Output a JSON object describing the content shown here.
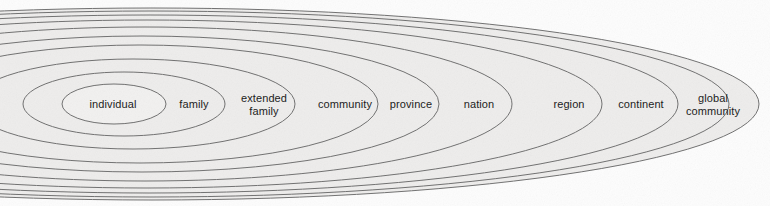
{
  "figure": {
    "kind": "nested-ellipses-diagram",
    "canvas": {
      "width": 770,
      "height": 206
    },
    "colors": {
      "background": "#fdfdfd",
      "ring_fill": "#eeedec",
      "innermost_fill": "#f2f1f0",
      "stroke": "#6f6f6f",
      "text": "#1d1d1d"
    }
  },
  "chart_data": {
    "type": "diagram",
    "title": "",
    "layout": "nested-ellipses",
    "levels": [
      {
        "index": 1,
        "label": "individual",
        "label_lines": [
          "individual"
        ],
        "cx": 114,
        "cy": 104,
        "rx": 52,
        "ry": 20,
        "label_x": 113,
        "label_y": 104
      },
      {
        "index": 2,
        "label": "family",
        "label_lines": [
          "family"
        ],
        "cx": 124,
        "cy": 104,
        "rx": 101,
        "ry": 32,
        "label_x": 194,
        "label_y": 104
      },
      {
        "index": 3,
        "label": "extended family",
        "label_lines": [
          "extended",
          "family"
        ],
        "cx": 133,
        "cy": 104,
        "rx": 162,
        "ry": 45,
        "label_x": 264,
        "label_y": 104
      },
      {
        "index": 4,
        "label": "community",
        "label_lines": [
          "community"
        ],
        "cx": 140,
        "cy": 104,
        "rx": 238,
        "ry": 59,
        "label_x": 345,
        "label_y": 104
      },
      {
        "index": 5,
        "label": "province",
        "label_lines": [
          "province"
        ],
        "cx": 142,
        "cy": 104,
        "rx": 297,
        "ry": 68,
        "label_x": 411,
        "label_y": 104
      },
      {
        "index": 6,
        "label": "nation",
        "label_lines": [
          "nation"
        ],
        "cx": 145,
        "cy": 104,
        "rx": 367,
        "ry": 77,
        "label_x": 479,
        "label_y": 104
      },
      {
        "index": 7,
        "label": "region",
        "label_lines": [
          "region"
        ],
        "cx": 147,
        "cy": 104,
        "rx": 455,
        "ry": 84,
        "label_x": 569,
        "label_y": 104
      },
      {
        "index": 8,
        "label": "continent",
        "label_lines": [
          "continent"
        ],
        "cx": 149,
        "cy": 104,
        "rx": 529,
        "ry": 89,
        "label_x": 641,
        "label_y": 104
      },
      {
        "index": 9,
        "label": "global community",
        "label_lines": [
          "global",
          "community"
        ],
        "cx": 151,
        "cy": 104,
        "rx": 578,
        "ry": 93,
        "label_x": 713,
        "label_y": 104
      },
      {
        "index": 10,
        "label": "",
        "label_lines": [],
        "cx": 152,
        "cy": 104,
        "rx": 607,
        "ry": 96,
        "label_x": 0,
        "label_y": 0
      }
    ]
  }
}
